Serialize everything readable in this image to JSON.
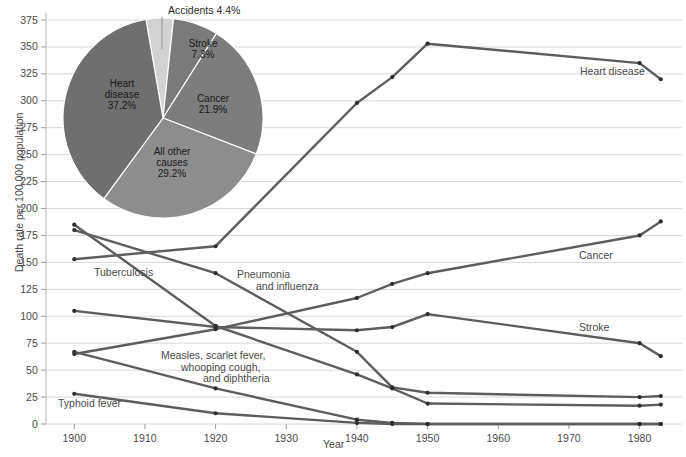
{
  "chart_data": {
    "type": "line",
    "title": "",
    "xlabel": "Year",
    "ylabel": "Death rate per 100,000 population",
    "xlim": [
      1896,
      1986
    ],
    "ylim": [
      0,
      375
    ],
    "grid": true,
    "legend_position": "inline-right",
    "y_ticks": [
      0,
      25,
      50,
      75,
      100,
      125,
      150,
      175,
      200,
      225,
      250,
      275,
      300,
      325,
      350,
      375
    ],
    "x_ticks": [
      1900,
      1910,
      1920,
      1930,
      1940,
      1950,
      1960,
      1970,
      1980
    ],
    "x": [
      1900,
      1920,
      1940,
      1945,
      1950,
      1980,
      1983
    ],
    "series": [
      {
        "name": "Heart disease",
        "label": "Heart disease",
        "values": [
          153,
          165,
          298,
          322,
          353,
          335,
          320
        ]
      },
      {
        "name": "Cancer",
        "label": "Cancer",
        "values": [
          65,
          88,
          117,
          130,
          140,
          175,
          188
        ]
      },
      {
        "name": "Stroke",
        "label": "Stroke",
        "values": [
          105,
          90,
          87,
          90,
          102,
          75,
          63
        ]
      },
      {
        "name": "Pneumonia and influenza",
        "label": "Pneumonia\nand influenza",
        "values": [
          180,
          140,
          67,
          34,
          29,
          25,
          26
        ]
      },
      {
        "name": "Tuberculosis",
        "label": "Tuberculosis",
        "values": [
          185,
          91,
          46,
          33,
          19,
          17,
          18
        ]
      },
      {
        "name": "Measles, scarlet fever, whooping cough, and diphtheria",
        "label": "Measles, scarlet fever,\nwhooping cough,\nand diphtheria",
        "values": [
          67,
          33,
          4,
          1,
          0,
          0,
          0
        ]
      },
      {
        "name": "Typhoid fever",
        "label": "Typhoid fever",
        "values": [
          28,
          10,
          1,
          0,
          0,
          0,
          0
        ]
      }
    ],
    "pie": {
      "title": "",
      "type": "pie",
      "slices": [
        {
          "name": "Heart disease",
          "label": "Heart\ndisease\n37.2%",
          "value": 37.2,
          "color": "#6f6f6f"
        },
        {
          "name": "All other causes",
          "label": "All other\ncauses\n29.2%",
          "value": 29.2,
          "color": "#8d8d8d"
        },
        {
          "name": "Cancer",
          "label": "Cancer\n21.9%",
          "value": 21.9,
          "color": "#7d7d7d"
        },
        {
          "name": "Stroke",
          "label": "Stroke\n7.3%",
          "value": 7.3,
          "color": "#7a7a7a"
        },
        {
          "name": "Accidents",
          "label": "Accidents 4.4%",
          "value": 4.4,
          "color": "#d2d2d2"
        }
      ]
    }
  },
  "axis": {
    "y_title": "Death rate per 100,000 population",
    "x_title": "Year",
    "y_ticks": [
      "375",
      "350",
      "325",
      "300",
      "275",
      "250",
      "225",
      "200",
      "175",
      "150",
      "125",
      "100",
      "75",
      "50",
      "25",
      "0"
    ],
    "x_ticks": [
      "1900",
      "1910",
      "1920",
      "1930",
      "1940",
      "1950",
      "1960",
      "1970",
      "1980"
    ]
  },
  "series_labels": {
    "heart_disease": "Heart disease",
    "cancer": "Cancer",
    "stroke": "Stroke",
    "pneumonia_line1": "Pneumonia",
    "pneumonia_line2": "and influenza",
    "tuberculosis": "Tuberculosis",
    "measles_line1": "Measles, scarlet fever,",
    "measles_line2": "whooping cough,",
    "measles_line3": "and diphtheria",
    "typhoid": "Typhoid fever"
  },
  "pie_labels": {
    "accidents": "Accidents 4.4%",
    "stroke_line1": "Stroke",
    "stroke_line2": "7.3%",
    "cancer_line1": "Cancer",
    "cancer_line2": "21.9%",
    "other_line1": "All other",
    "other_line2": "causes",
    "other_line3": "29.2%",
    "heart_line1": "Heart",
    "heart_line2": "disease",
    "heart_line3": "37.2%"
  },
  "colors": {
    "line": "#5d5d5d",
    "grid": "#d8d8d8",
    "text": "#4a4a4a",
    "pie_heart": "#6f6f6f",
    "pie_other": "#8d8d8d",
    "pie_cancer": "#7d7d7d",
    "pie_stroke": "#7a7a7a",
    "pie_accidents": "#d2d2d2"
  }
}
